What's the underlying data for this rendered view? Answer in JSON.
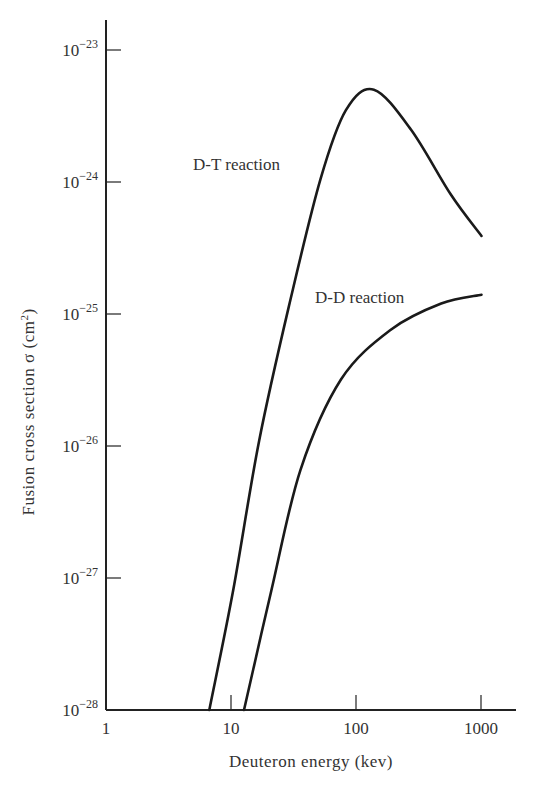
{
  "chart_data": {
    "type": "line",
    "title": "",
    "xlabel": "Deuteron energy (kev)",
    "ylabel": "Fusion cross section σ (cm²)",
    "xscale": "log",
    "yscale": "log",
    "xlim": [
      1,
      2000
    ],
    "ylim": [
      1e-28,
      1e-23
    ],
    "grid": false,
    "legend": "inline labels",
    "x_ticks": [
      {
        "value": 1,
        "label": "1"
      },
      {
        "value": 10,
        "label": "10"
      },
      {
        "value": 100,
        "label": "100"
      },
      {
        "value": 1000,
        "label": "1000"
      }
    ],
    "y_ticks": [
      {
        "value": 1e-23,
        "base": "10",
        "exp": "−23"
      },
      {
        "value": 1e-24,
        "base": "10",
        "exp": "−24"
      },
      {
        "value": 1e-25,
        "base": "10",
        "exp": "−25"
      },
      {
        "value": 1e-26,
        "base": "10",
        "exp": "−26"
      },
      {
        "value": 1e-27,
        "base": "10",
        "exp": "−27"
      },
      {
        "value": 1e-28,
        "base": "10",
        "exp": "−28"
      }
    ],
    "series": [
      {
        "name": "D-T reaction",
        "label": "D-T reaction",
        "x": [
          6.7,
          10.4,
          16.8,
          30,
          52,
          83,
          139,
          275,
          575,
          1010
        ],
        "y": [
          1e-28,
          8e-28,
          1.1e-26,
          1.3e-25,
          1.05e-24,
          3.5e-24,
          5e-24,
          2.5e-24,
          8e-25,
          3.9e-25
        ]
      },
      {
        "name": "D-D reaction",
        "label": "D-D reaction",
        "x": [
          12.7,
          21,
          36,
          76,
          190,
          480,
          1010
        ],
        "y": [
          1e-28,
          8e-28,
          6.6e-27,
          3.2e-26,
          7.6e-26,
          1.2e-25,
          1.4e-25
        ]
      }
    ]
  },
  "labels": {
    "xlabel": "Deuteron energy (kev)",
    "ylabel_main": "Fusion cross section σ (cm",
    "ylabel_sup": "2",
    "ylabel_close": ")",
    "dt": "D-T reaction",
    "dd": "D-D reaction"
  },
  "style": {
    "line_color": "#1a1a1a",
    "axis_color": "#222222",
    "text_color": "#333333"
  }
}
